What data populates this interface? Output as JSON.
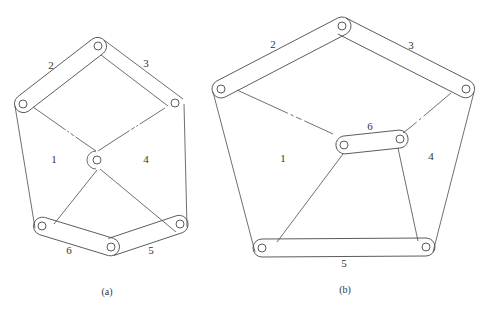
{
  "figures": [
    {
      "id": "a",
      "caption": "(a)",
      "labels": {
        "l1": "1",
        "l2": "2",
        "l3": "3",
        "l4": "4",
        "l5": "5",
        "l6": "6"
      },
      "joints": {
        "top": [
          98,
          46
        ],
        "left": [
          23,
          104
        ],
        "right": [
          175,
          103
        ],
        "center": [
          97,
          160
        ],
        "bottom_left": [
          42,
          226
        ],
        "bottom_mid": [
          111,
          247
        ],
        "bottom_right": [
          180,
          224
        ]
      }
    },
    {
      "id": "b",
      "caption": "(b)",
      "labels": {
        "l1": "1",
        "l2": "2",
        "l3": "3",
        "l4": "4",
        "l5": "5",
        "l6": "6"
      },
      "joints": {
        "top": [
          342,
          26
        ],
        "left": [
          221,
          89
        ],
        "right": [
          466,
          89
        ],
        "mid_left": [
          344,
          145
        ],
        "mid_right": [
          400,
          139
        ],
        "bottom_left": [
          262,
          248
        ],
        "bottom_right": [
          426,
          247
        ]
      }
    }
  ],
  "colors": {
    "stroke": "#4a4a4a",
    "background": "#ffffff"
  }
}
